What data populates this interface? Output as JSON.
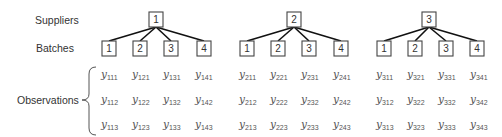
{
  "labels": {
    "suppliers": "Suppliers",
    "batches": "Batches",
    "observations": "Observations"
  },
  "suppliers": [
    {
      "label": "1",
      "batches": [
        "1",
        "2",
        "3",
        "4"
      ],
      "observations": [
        [
          "111",
          "121",
          "131",
          "141"
        ],
        [
          "112",
          "122",
          "132",
          "142"
        ],
        [
          "113",
          "123",
          "133",
          "143"
        ]
      ]
    },
    {
      "label": "2",
      "batches": [
        "1",
        "2",
        "3",
        "4"
      ],
      "observations": [
        [
          "211",
          "221",
          "231",
          "241"
        ],
        [
          "212",
          "222",
          "232",
          "242"
        ],
        [
          "213",
          "223",
          "233",
          "243"
        ]
      ]
    },
    {
      "label": "3",
      "batches": [
        "1",
        "2",
        "3",
        "4"
      ],
      "observations": [
        [
          "311",
          "321",
          "331",
          "341"
        ],
        [
          "312",
          "322",
          "332",
          "342"
        ],
        [
          "313",
          "323",
          "333",
          "343"
        ]
      ]
    }
  ],
  "observation_symbol": "y",
  "colors": {
    "box_stroke": "#444444",
    "edge": "#111111",
    "text": "#333333",
    "observation_text": "#555555"
  }
}
